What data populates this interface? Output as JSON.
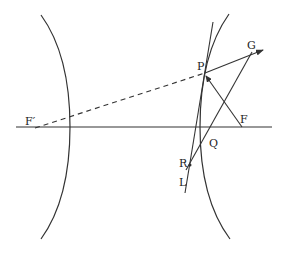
{
  "diagram": {
    "colors": {
      "stroke": "#333333",
      "background": "#ffffff"
    },
    "labels": {
      "F_prime": "F′",
      "F": "F",
      "P": "P",
      "G": "G",
      "Q": "Q",
      "R": "R",
      "L": "L"
    },
    "points": {
      "F_prime": [
        35,
        128
      ],
      "F": [
        242,
        127
      ],
      "P": [
        205,
        73
      ],
      "G": [
        252,
        52
      ],
      "Q": [
        207,
        143
      ],
      "R": [
        190,
        165
      ],
      "L": [
        185,
        193
      ]
    },
    "elements": [
      "left hyperbola branch",
      "right hyperbola branch",
      "horizontal axis",
      "dashed line F′P",
      "tangent line through P",
      "line PF",
      "arrow P to G",
      "line G to R via Q"
    ]
  }
}
